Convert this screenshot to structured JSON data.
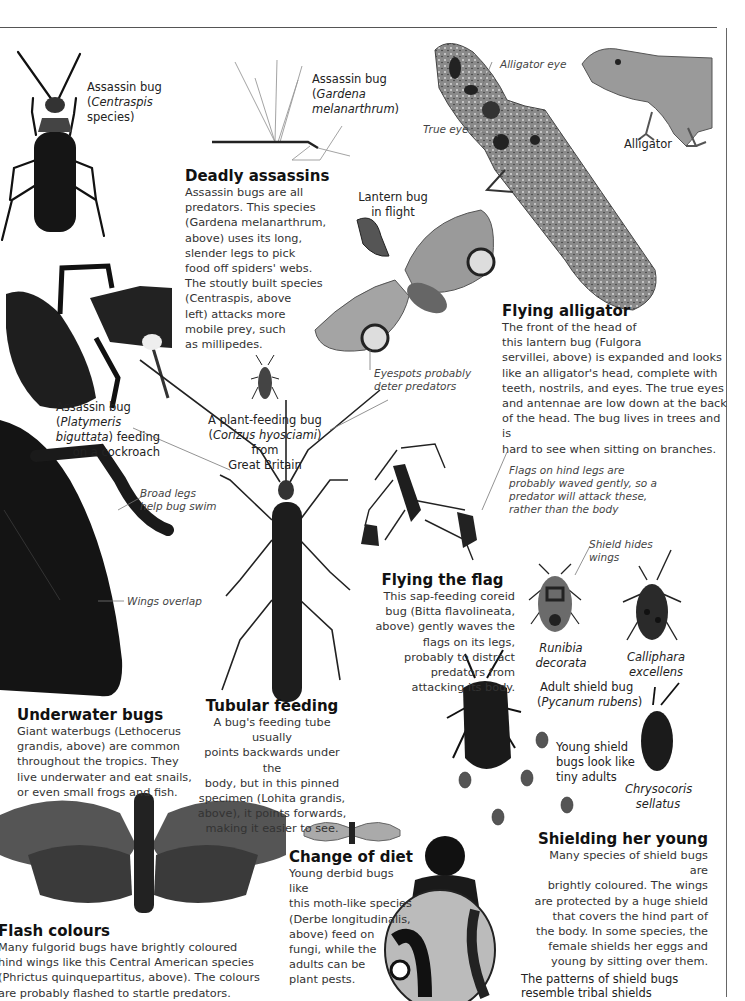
{
  "page": {
    "background": "#ffffff",
    "rule_color": "#555555"
  },
  "labels": {
    "assassin_centraspis": {
      "line1": "Assassin bug",
      "line2_pre": "(",
      "line2_italic": "Centraspis",
      "line3": "species)"
    },
    "assassin_gardena": {
      "line1": "Assassin bug",
      "line2_pre": "(",
      "line2_italic": "Gardena",
      "line3_italic": "melanarthrum",
      "line3_post": ")"
    },
    "lantern_bug": {
      "line1": "Lantern bug",
      "line2": "in flight"
    },
    "alligator_eye": "Alligator eye",
    "true_eye": "True eye",
    "alligator": "Alligator",
    "eyespots": {
      "line1": "Eyespots probably",
      "line2": "deter predators"
    },
    "assassin_platymeris": {
      "line1": "Assassin bug",
      "line2_pre": "(",
      "line2_italic": "Platymeris",
      "line3_italic": "biguttata",
      "line3_post": ") feeding",
      "line4": "on a cockroach"
    },
    "plant_feeding": {
      "line1": "A plant-feeding bug",
      "line2_pre": "(",
      "line2_italic": "Corizus hyosciami",
      "line2_post": ") from",
      "line3": "Great Britain"
    },
    "broad_legs": {
      "line1": "Broad legs",
      "line2": "help bug swim"
    },
    "wings_overlap": "Wings overlap",
    "flags_note": {
      "line1": "Flags on hind legs are",
      "line2": "probably waved gently, so a",
      "line3": "predator will attack these,",
      "line4": "rather than the body"
    },
    "shield_hides": {
      "line1": "Shield hides",
      "line2": "wings"
    },
    "runibia": {
      "line1": "Runibia",
      "line2": "decorata"
    },
    "calliphara": {
      "line1": "Calliphara",
      "line2": "excellens"
    },
    "adult_shield": {
      "line1": "Adult shield bug",
      "line2_pre": "(",
      "line2_italic": "Pycanum rubens",
      "line2_post": ")"
    },
    "young_shield": {
      "line1": "Young shield",
      "line2": "bugs look like",
      "line3": "tiny adults"
    },
    "chrysocoris": {
      "line1": "Chrysocoris",
      "line2": "sellatus"
    },
    "tribal_shields": {
      "line1": "The patterns of shield bugs",
      "line2": "resemble tribal shields"
    }
  },
  "sections": {
    "deadly_assassins": {
      "heading": "Deadly assassins",
      "lines": [
        "Assassin bugs are all",
        "predators. This species",
        "(Gardena melanarthrum,",
        "above) uses its long,",
        "slender legs to pick",
        "food off spiders' webs.",
        "The stoutly built species",
        "(Centraspis, above",
        "left) attacks more",
        "mobile prey, such",
        "as millipedes."
      ]
    },
    "flying_alligator": {
      "heading": "Flying alligator",
      "lines": [
        "The front of the head of",
        "this lantern bug (Fulgora",
        "servillei, above) is expanded and looks",
        "like an alligator's head, complete with",
        "teeth, nostrils, and eyes. The true eyes",
        "and antennae are low down at the back",
        "of the head. The bug lives in trees and is",
        "hard to see when sitting on branches."
      ]
    },
    "flying_flag": {
      "heading": "Flying the flag",
      "lines": [
        "This sap-feeding coreid",
        "bug (Bitta flavolineata,",
        "above) gently waves the",
        "flags on its legs,",
        "probably to distract",
        "predators from",
        "attacking its body."
      ]
    },
    "underwater_bugs": {
      "heading": "Underwater bugs",
      "lines": [
        "Giant waterbugs (Lethocerus",
        "grandis, above) are common",
        "throughout the tropics. They",
        "live underwater and eat snails,",
        "or even small frogs and fish."
      ]
    },
    "tubular_feeding": {
      "heading": "Tubular feeding",
      "lines": [
        "A bug's feeding tube usually",
        "points backwards under the",
        "body, but in this pinned",
        "specimen (Lohita grandis,",
        "above), it points forwards,",
        "making it easier to see."
      ]
    },
    "flash_colours": {
      "heading": "Flash colours",
      "lines": [
        "Many fulgorid bugs have brightly coloured",
        "hind wings like this Central American species",
        "(Phrictus quinquepartitus, above). The colours",
        "are probably flashed to startle predators."
      ]
    },
    "change_of_diet": {
      "heading": "Change of diet",
      "lines": [
        "Young derbid bugs like",
        "this moth-like species",
        "(Derbe longitudinalis,",
        "above) feed on",
        "fungi, while the",
        "adults can be",
        "plant pests."
      ]
    },
    "shielding_young": {
      "heading": "Shielding her young",
      "lines": [
        "Many species of shield bugs are",
        "brightly coloured. The wings",
        "are protected by a huge shield",
        "that covers the hind part of",
        "the body. In some species, the",
        "female shields her eggs and",
        "young by sitting over them."
      ]
    }
  }
}
